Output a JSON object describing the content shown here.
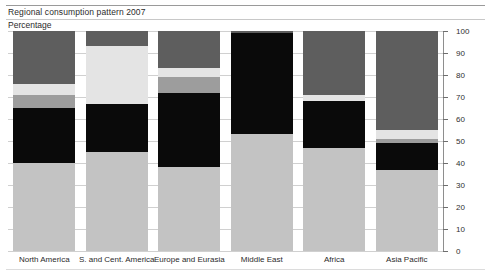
{
  "header": {
    "title": "Regional consumption pattern 2007",
    "subtitle": "Percentage"
  },
  "chart_data": {
    "type": "bar",
    "title": "Regional consumption pattern 2007",
    "subtitle": "Percentage",
    "stacked": true,
    "stack_mode": "percent",
    "xlabel": "",
    "ylabel": "Percentage",
    "ylim": [
      0,
      100
    ],
    "yticks": [
      0,
      10,
      20,
      30,
      40,
      50,
      60,
      70,
      80,
      90,
      100
    ],
    "ytick_labels": [
      "0",
      "10",
      "20",
      "30",
      "40",
      "50",
      "60",
      "70",
      "80",
      "90",
      "100"
    ],
    "grid": true,
    "axis_position": "right",
    "legend": "none",
    "categories": [
      "North America",
      "S. and Cent. America",
      "Europe and Eurasia",
      "Middle East",
      "Africa",
      "Asia Pacific"
    ],
    "series": [
      {
        "name": "segment-bottom",
        "color": "#c3c3c3",
        "values": [
          40,
          45,
          38,
          53,
          47,
          37
        ]
      },
      {
        "name": "segment-dark",
        "color": "#0a0a0a",
        "values": [
          25,
          22,
          34,
          46,
          21,
          12
        ]
      },
      {
        "name": "segment-mid-gray",
        "color": "#9d9d9d",
        "values": [
          6,
          0,
          7,
          0,
          0,
          2
        ]
      },
      {
        "name": "segment-light",
        "color": "#e4e4e4",
        "values": [
          5,
          26,
          4,
          0,
          3,
          4
        ]
      },
      {
        "name": "segment-top",
        "color": "#5e5e5e",
        "values": [
          24,
          7,
          17,
          1,
          29,
          45
        ]
      }
    ]
  },
  "colors": {
    "segment_bottom": "#c3c3c3",
    "segment_dark": "#0a0a0a",
    "segment_mid_gray": "#9d9d9d",
    "segment_light": "#e4e4e4",
    "segment_top": "#5e5e5e",
    "grid": "#d0d0d0",
    "axis": "#8e8e8e",
    "text": "#2b2b2b",
    "background": "#ffffff"
  }
}
